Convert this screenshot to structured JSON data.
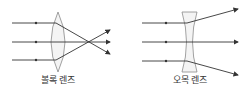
{
  "diagram": {
    "convex": {
      "label": "볼록 렌즈"
    },
    "concave": {
      "label": "오목 렌즈"
    },
    "colors": {
      "ray": "#333333",
      "lens_stroke": "#8a8a8a",
      "lens_fill": "#f4f4f4"
    }
  }
}
